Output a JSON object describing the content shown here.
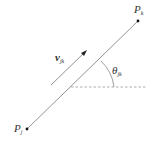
{
  "diagram": {
    "points": {
      "pj": {
        "label": "P",
        "sub": "j",
        "x": 27,
        "y": 129
      },
      "pk": {
        "label": "P",
        "sub": "k",
        "x": 138,
        "y": 21
      }
    },
    "velocity": {
      "label": "v",
      "sub": "jk"
    },
    "angle": {
      "label": "θ",
      "sub": "jk"
    },
    "colors": {
      "line": "#777777",
      "dashed": "#888888",
      "text": "#333333",
      "dot": "#111111"
    }
  }
}
